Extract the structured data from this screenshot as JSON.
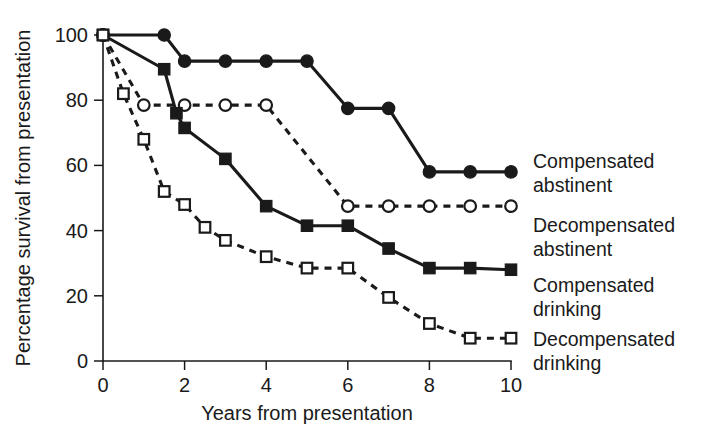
{
  "chart_data": {
    "type": "line",
    "title": "",
    "xlabel": "Years from presentation",
    "ylabel": "Percentage survival from presentation",
    "xlim": [
      0,
      10
    ],
    "ylim": [
      0,
      100
    ],
    "xticks": [
      0,
      2,
      4,
      6,
      8,
      10
    ],
    "yticks": [
      0,
      20,
      40,
      60,
      80,
      100
    ],
    "xtick_labels": [
      "0",
      "2",
      "4",
      "6",
      "8",
      "10"
    ],
    "ytick_labels": [
      "0",
      "20",
      "40",
      "60",
      "80",
      "100"
    ],
    "grid": false,
    "legend_position": "right-inline",
    "series": [
      {
        "name": "Compensated abstinent",
        "label_line1": "Compensated",
        "label_line2": "abstinent",
        "marker": "filled-circle",
        "linestyle": "solid",
        "color": "#1a1a1a",
        "x": [
          0,
          1.5,
          2,
          3,
          4,
          5,
          6,
          7,
          8,
          9,
          10
        ],
        "y": [
          100,
          100,
          92,
          92,
          92,
          92,
          77.5,
          77.5,
          58,
          58,
          58
        ]
      },
      {
        "name": "Decompensated abstinent",
        "label_line1": "Decompensated",
        "label_line2": "abstinent",
        "marker": "open-circle",
        "linestyle": "dashed",
        "color": "#1a1a1a",
        "x": [
          0,
          1,
          2,
          3,
          4,
          6,
          7,
          8,
          9,
          10
        ],
        "y": [
          100,
          78.5,
          78.5,
          78.5,
          78.5,
          47.5,
          47.5,
          47.5,
          47.5,
          47.5
        ]
      },
      {
        "name": "Compensated drinking",
        "label_line1": "Compensated",
        "label_line2": "drinking",
        "marker": "filled-square",
        "linestyle": "solid",
        "color": "#1a1a1a",
        "x": [
          0,
          1.5,
          1.8,
          2,
          3,
          4,
          5,
          6,
          7,
          8,
          9,
          10
        ],
        "y": [
          100,
          89.5,
          76,
          71.5,
          62,
          47.5,
          41.5,
          41.5,
          34.5,
          28.5,
          28.5,
          28
        ],
        "note": "steep drop between 1.5 and 2 years"
      },
      {
        "name": "Decompensated drinking",
        "label_line1": "Decompensated",
        "label_line2": "drinking",
        "marker": "open-square",
        "linestyle": "dashed",
        "color": "#1a1a1a",
        "x": [
          0,
          0.5,
          1,
          1.5,
          2,
          2.5,
          3,
          4,
          5,
          6,
          7,
          8,
          9,
          10
        ],
        "y": [
          100,
          82,
          68,
          52,
          48,
          41,
          37,
          32,
          28.5,
          28.5,
          19.5,
          11.5,
          7,
          7
        ]
      }
    ]
  },
  "axes": {
    "x_title": "Years from presentation",
    "y_title": "Percentage survival from presentation"
  }
}
